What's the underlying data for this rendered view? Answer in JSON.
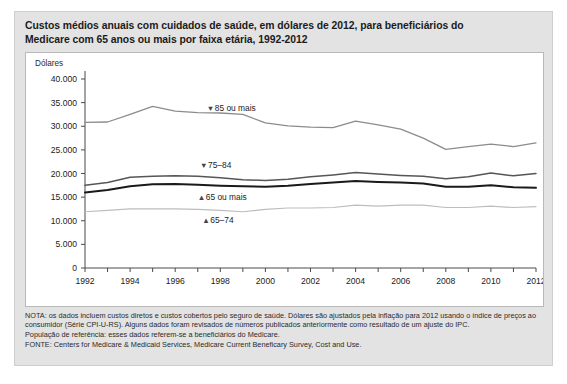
{
  "title": {
    "line1": "Custos médios anuais com cuidados de saúde, em dólares de 2012, para beneficiários do",
    "line2": "Medicare com 65 anos ou mais por faixa etária, 1992-2012"
  },
  "axis": {
    "y_title": "Dólares",
    "y_ticks": [
      "40.000",
      "35.000",
      "30.000",
      "25.000",
      "20.000",
      "15.000",
      "10.000",
      "5.000",
      "0"
    ],
    "x_ticks": [
      "1992",
      "1994",
      "1996",
      "1998",
      "2000",
      "2002",
      "2004",
      "2006",
      "2008",
      "2010",
      "2012"
    ]
  },
  "series_labels": {
    "s85": "85 ou mais",
    "s7584": "75–84",
    "s65p": "65 ou mais",
    "s6574": "65–74"
  },
  "notes": {
    "nota": "NOTA: os dados incluem custos diretos e custos cobertos pelo seguro de saúde. Dólares são ajustados pela inflação para 2012 usando o índice de preços ao consumidor (Série CPI-U-RS). Alguns dados foram revisados de números publicados anteriormente como resultado de um ajuste do IPC.",
    "populacao": "População de referência: esses dados referem-se a beneficiários do Medicare.",
    "fonte": "FONTE: Centers for Medicare & Medicaid Services, Medicare Current Beneficary Survey, Cost and Use."
  },
  "caption_sliver": "",
  "colors": {
    "panel_bg": "#ffffff",
    "figure_bg": "#e3e3e3",
    "s85": "#8c8c8c",
    "s7584": "#565656",
    "s65p": "#1a1a1a",
    "s6574": "#bdbdbd"
  },
  "chart_data": {
    "type": "line",
    "title": "Custos médios anuais com cuidados de saúde, em dólares de 2012, para beneficiários do Medicare com 65 anos ou mais por faixa etária, 1992-2012",
    "xlabel": "",
    "ylabel": "Dólares",
    "xlim": [
      1992,
      2012
    ],
    "ylim": [
      0,
      40000
    ],
    "ytick_step": 5000,
    "grid": false,
    "legend": "inline-annotations",
    "x": [
      1992,
      1993,
      1994,
      1995,
      1996,
      1997,
      1998,
      1999,
      2000,
      2001,
      2002,
      2003,
      2004,
      2005,
      2006,
      2007,
      2008,
      2009,
      2010,
      2011,
      2012
    ],
    "series": [
      {
        "name": "85 ou mais",
        "color": "#8c8c8c",
        "values": [
          30800,
          30900,
          32500,
          34200,
          33200,
          32900,
          32800,
          32500,
          30700,
          30100,
          29800,
          29700,
          31100,
          30300,
          29400,
          27500,
          25100,
          25700,
          26200,
          25700,
          26500
        ]
      },
      {
        "name": "75–84",
        "color": "#565656",
        "values": [
          17500,
          18100,
          19200,
          19400,
          19500,
          19400,
          19100,
          18700,
          18500,
          18800,
          19300,
          19700,
          20200,
          19900,
          19600,
          19400,
          18900,
          19300,
          20100,
          19500,
          20000
        ]
      },
      {
        "name": "65 ou mais",
        "color": "#1a1a1a",
        "values": [
          16000,
          16500,
          17300,
          17700,
          17800,
          17600,
          17400,
          17300,
          17200,
          17400,
          17800,
          18100,
          18400,
          18200,
          18100,
          17900,
          17200,
          17200,
          17500,
          17100,
          17000
        ]
      },
      {
        "name": "65–74",
        "color": "#bdbdbd",
        "values": [
          11900,
          12200,
          12500,
          12500,
          12500,
          12400,
          12200,
          11900,
          12400,
          12700,
          12700,
          12800,
          13300,
          13100,
          13300,
          13300,
          12800,
          12800,
          13100,
          12800,
          13000
        ]
      }
    ],
    "annotations": [
      {
        "text": "85 ou mais",
        "marker": "▼",
        "x": 1997.4,
        "y": 34000
      },
      {
        "text": "75–84",
        "marker": "▼",
        "x": 1997.1,
        "y": 21900
      },
      {
        "text": "65 ou mais",
        "marker": "▲",
        "x": 1997.0,
        "y": 15100
      },
      {
        "text": "65–74",
        "marker": "▲",
        "x": 1997.2,
        "y": 10100
      }
    ]
  }
}
